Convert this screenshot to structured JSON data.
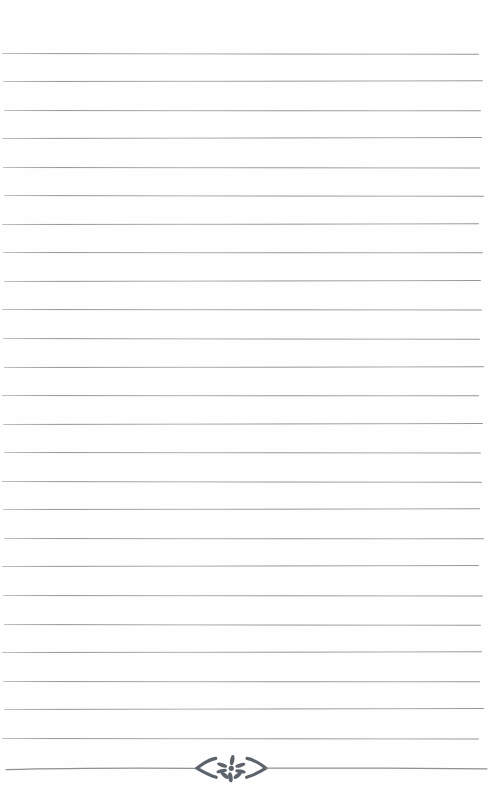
{
  "page": {
    "kind": "blank lined journal page",
    "background": "#fefefe"
  },
  "ruled_lines": {
    "count": 25,
    "color": "#8d908e"
  },
  "footer_divider": {
    "color": "#5c636b",
    "rule_color": "#8d908e",
    "parts": [
      "rule-left",
      "left-chevron",
      "flower-rosette",
      "right-chevron",
      "rule-right"
    ]
  }
}
